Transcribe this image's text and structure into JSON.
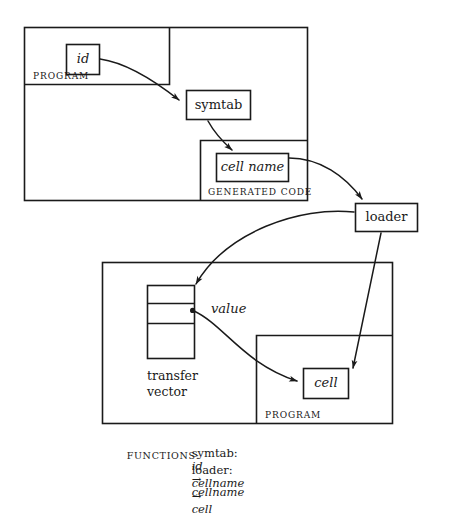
{
  "figure": {
    "stroke_color": "#1a1a1a",
    "background": "#ffffff"
  },
  "top_panel": {
    "outer_label": "PROGRAM",
    "id_box": {
      "label": "id"
    },
    "symtab_box": {
      "label": "symtab"
    },
    "generated_code": {
      "label": "GENERATED CODE",
      "cell_name_box": {
        "label": "cell name"
      }
    }
  },
  "loader_box": {
    "label": "loader"
  },
  "bottom_panel": {
    "transfer_vector": {
      "label_line1": "transfer",
      "label_line2": "vector",
      "value_label": "value",
      "slot_count": 4
    },
    "inner_program": {
      "label": "PROGRAM",
      "cell_box": {
        "label": "cell"
      }
    }
  },
  "caption": {
    "heading": "FUNCTIONS:",
    "lines": [
      {
        "name": "symtab",
        "separator": ":",
        "domain": "id",
        "arrow": "→",
        "range": "cellname"
      },
      {
        "name": "loader",
        "separator": ":",
        "domain": "cellname",
        "arrow": "→",
        "range": "cell"
      }
    ]
  }
}
